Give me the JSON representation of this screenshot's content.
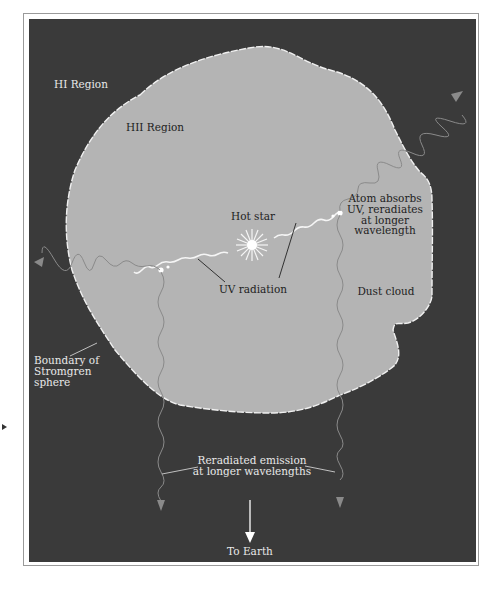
{
  "figure": {
    "colors": {
      "background": "#3a3a3a",
      "hii_region": "#b4b4b4",
      "boundary": "#f0f0f0",
      "uv_radiation": "#f5f5f5",
      "reradiated": "#8a8a8a",
      "leader_line_dark": "#222222",
      "leader_line_light": "#cfcfcf"
    },
    "labels": {
      "hi_region": "HI Region",
      "hii_region": "HII Region",
      "hot_star": "Hot star",
      "atom_absorbs": [
        "Atom absorbs",
        "UV, reradiates",
        "at longer",
        "wavelength"
      ],
      "uv_radiation": "UV radiation",
      "dust_cloud": "Dust cloud",
      "boundary": [
        "Boundary of",
        "Stromgren",
        "sphere"
      ],
      "reradiated_emission": [
        "Reradiated emission",
        "at longer wavelengths"
      ],
      "to_earth": "To Earth"
    },
    "icons": {
      "star": "hot-star-icon",
      "absorbing_atom": "atom-icon",
      "arrow": "arrowhead-icon"
    }
  }
}
